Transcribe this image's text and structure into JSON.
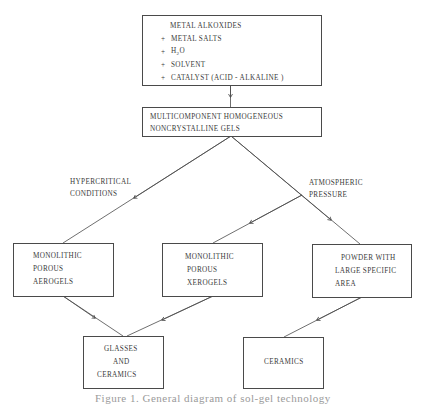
{
  "diagram": {
    "inputs_box": {
      "lines": [
        {
          "bullet": "",
          "text": "METAL  ALKOXIDES"
        },
        {
          "bullet": "+",
          "text": "METAL SALTS"
        },
        {
          "bullet": "+",
          "text": "H2O",
          "formula": {
            "base": "H",
            "sub": "2",
            "rest": "O"
          }
        },
        {
          "bullet": "+",
          "text": "SOLVENT"
        },
        {
          "bullet": "+",
          "text": "CATALYST  (ACID - ALKALINE )"
        }
      ]
    },
    "gels_box": {
      "lines": [
        "MULTICOMPONENT HOMOGENEOUS",
        "NONCRYSTALLINE  GELS"
      ]
    },
    "branch_labels": {
      "left": [
        "HYPERCRITICAL",
        "CONDITIONS"
      ],
      "right": [
        "ATMOSPHERIC",
        "PRESSURE"
      ]
    },
    "aerogels_box": {
      "lines": [
        "MONOLITHIC",
        "POROUS",
        "AEROGELS"
      ]
    },
    "xerogels_box": {
      "lines": [
        "MONOLITHIC",
        "POROUS",
        "XEROGELS"
      ]
    },
    "powder_box": {
      "lines": [
        "POWDER WITH",
        "LARGE SPECIFIC",
        "AREA"
      ]
    },
    "glasses_box": {
      "lines": [
        "GLASSES",
        "AND",
        "CERAMICS"
      ]
    },
    "ceramics_box": {
      "lines": [
        "CERAMICS"
      ]
    },
    "edges": [
      {
        "from": "inputs_box",
        "to": "gels_box"
      },
      {
        "from": "gels_box",
        "to": "aerogels_box",
        "label": "HYPERCRITICAL CONDITIONS"
      },
      {
        "from": "gels_box",
        "to": "xerogels_box",
        "label": "ATMOSPHERIC PRESSURE"
      },
      {
        "from": "gels_box",
        "to": "powder_box",
        "label": "ATMOSPHERIC PRESSURE"
      },
      {
        "from": "aerogels_box",
        "to": "glasses_box"
      },
      {
        "from": "xerogels_box",
        "to": "glasses_box"
      },
      {
        "from": "powder_box",
        "to": "ceramics_box"
      }
    ],
    "line_color": "#4a4a4a"
  },
  "caption": "Figure 1. General diagram of sol-gel technology"
}
